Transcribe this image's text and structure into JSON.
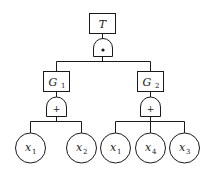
{
  "diagram": {
    "type": "fault-tree",
    "top_event": {
      "label": "T",
      "gate": "AND",
      "gate_symbol": "•"
    },
    "gates": [
      {
        "label": "G",
        "sub": "1",
        "gate": "OR",
        "gate_symbol": "+",
        "children": [
          "x1",
          "x2"
        ]
      },
      {
        "label": "G",
        "sub": "2",
        "gate": "OR",
        "gate_symbol": "+",
        "children": [
          "x1",
          "x4",
          "x3"
        ]
      }
    ],
    "basic_events": [
      {
        "label": "x",
        "sub": "1"
      },
      {
        "label": "x",
        "sub": "2"
      },
      {
        "label": "x",
        "sub": "1"
      },
      {
        "label": "x",
        "sub": "4"
      },
      {
        "label": "x",
        "sub": "3"
      }
    ],
    "colors": {
      "stroke": "#1a1a1a",
      "background": "#ffffff"
    }
  }
}
